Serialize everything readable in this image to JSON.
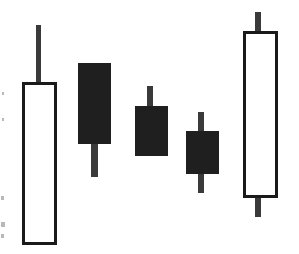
{
  "chart_data": {
    "type": "candlestick",
    "title": "",
    "subtitle": "",
    "xlabel": "",
    "ylabel": "",
    "grid": false,
    "legend": false,
    "axes_visible": false,
    "tick_labels_visible": false,
    "price_axis_note": "Unlabeled axis; values are read as inverted pixel positions (higher on screen = higher price).",
    "colors": {
      "up_body_fill": "#ffffff",
      "up_body_stroke": "#1a1a1a",
      "down_body_fill": "#1f1f1f",
      "down_body_stroke": "#1f1f1f",
      "wick": "#3a3a3a",
      "background": "#ffffff"
    },
    "categories": [
      "1",
      "2",
      "3",
      "4",
      "5"
    ],
    "candles": [
      {
        "index": 1,
        "label": "1",
        "direction": "up",
        "filled": false,
        "open": 9,
        "close": 172,
        "high": 229,
        "low": 9,
        "px": {
          "x_left": 22,
          "x_right": 57,
          "x_center": 39.5,
          "body_top": 82,
          "body_bottom": 245,
          "wick_top": 25,
          "wick_bottom": 245,
          "wick_x": 38,
          "wick_width": 5
        }
      },
      {
        "index": 2,
        "label": "2",
        "direction": "down",
        "filled": true,
        "open": 191,
        "close": 111,
        "high": 191,
        "low": 77,
        "px": {
          "x_left": 78,
          "x_right": 110,
          "x_center": 94,
          "body_top": 63,
          "body_bottom": 143,
          "wick_top": 63,
          "wick_bottom": 177,
          "wick_x": 94,
          "wick_width": 7
        }
      },
      {
        "index": 3,
        "label": "3",
        "direction": "down",
        "filled": true,
        "open": 148,
        "close": 99,
        "high": 168,
        "low": 99,
        "px": {
          "x_left": 135,
          "x_right": 167,
          "x_center": 151,
          "body_top": 106,
          "body_bottom": 155,
          "wick_top": 86,
          "wick_bottom": 155,
          "wick_x": 150,
          "wick_width": 6
        }
      },
      {
        "index": 4,
        "label": "4",
        "direction": "down",
        "filled": true,
        "open": 123,
        "close": 81,
        "high": 142,
        "low": 61,
        "px": {
          "x_left": 186,
          "x_right": 218,
          "x_center": 202,
          "body_top": 131,
          "body_bottom": 173,
          "wick_top": 112,
          "wick_bottom": 193,
          "wick_x": 201,
          "wick_width": 6
        }
      },
      {
        "index": 5,
        "label": "5",
        "direction": "up",
        "filled": false,
        "open": 56,
        "close": 223,
        "high": 242,
        "low": 37,
        "px": {
          "x_left": 243,
          "x_right": 278,
          "x_center": 260.5,
          "body_top": 31,
          "body_bottom": 198,
          "wick_top": 12,
          "wick_bottom": 217,
          "wick_x": 258,
          "wick_width": 6
        }
      }
    ],
    "annotations": [],
    "scan_artifacts": [
      {
        "x": 1,
        "y": 196,
        "w": 3,
        "h": 4
      },
      {
        "x": 1,
        "y": 222,
        "w": 4,
        "h": 5
      },
      {
        "x": 1,
        "y": 234,
        "w": 3,
        "h": 4
      },
      {
        "x": 2,
        "y": 92,
        "w": 2,
        "h": 3
      },
      {
        "x": 2,
        "y": 118,
        "w": 2,
        "h": 3
      }
    ]
  },
  "figure": {
    "caption": "",
    "width_px": 299,
    "height_px": 254
  }
}
